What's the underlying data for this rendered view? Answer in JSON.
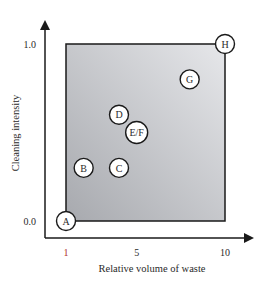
{
  "chart_data": {
    "type": "scatter",
    "title": "",
    "xlabel": "Relative volume of waste",
    "ylabel": "Cleaning intensity",
    "xlim": [
      1,
      10
    ],
    "ylim": [
      0.0,
      1.0
    ],
    "x_ticks": [
      {
        "value": 1,
        "label": "1"
      },
      {
        "value": 5,
        "label": "5"
      },
      {
        "value": 10,
        "label": "10"
      }
    ],
    "y_ticks": [
      {
        "value": 0.0,
        "label": "0.0"
      },
      {
        "value": 1.0,
        "label": "1.0"
      }
    ],
    "grid": false,
    "shaded_region": {
      "x": [
        1,
        10
      ],
      "y": [
        0.0,
        1.0
      ]
    },
    "points": [
      {
        "label": "A",
        "x": 1,
        "y": 0.0
      },
      {
        "label": "B",
        "x": 2,
        "y": 0.3
      },
      {
        "label": "C",
        "x": 4,
        "y": 0.3
      },
      {
        "label": "D",
        "x": 4,
        "y": 0.6
      },
      {
        "label": "E/F",
        "x": 5,
        "y": 0.5
      },
      {
        "label": "G",
        "x": 8,
        "y": 0.8
      },
      {
        "label": "H",
        "x": 10,
        "y": 1.0
      }
    ],
    "colors": {
      "axis": "#1a1a1a",
      "tick_one": "#b03030",
      "region_light": "#e6e7ea",
      "region_dark": "#a7a9ae"
    }
  }
}
